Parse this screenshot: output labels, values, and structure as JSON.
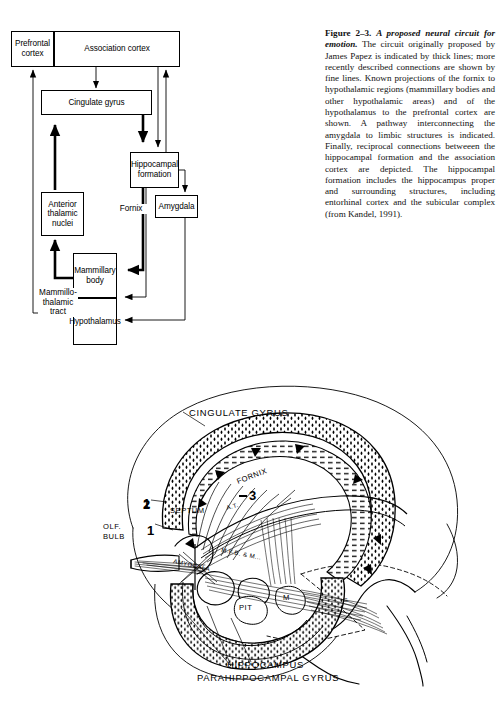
{
  "figure": {
    "caption_label": "Figure 2–3.",
    "caption_title": "A proposed neural circuit for emotion.",
    "caption_body": " The circuit originally proposed by James Papez is indicated by thick lines; more recently described connections are shown by fine lines. Known projections of the fornix to hypothalamic regions (mammillary bodies and other hypothalamic areas) and of the hypothalamus to the prefrontal cortex are shown. A pathway interconnecting the amygdala to limbic structures is indicated. Finally, reciprocal connections betweeen the hippocampal formation and the association cortex are depicted. The hippocampal formation includes the hippocampus proper and surrounding structures, including entorhinal cortex and the subicular complex (from Kandel, 1991)."
  },
  "flowchart": {
    "boxes": [
      {
        "id": "prefrontal-cortex",
        "label": "Prefrontal\ncortex"
      },
      {
        "id": "association-cortex",
        "label": "Association cortex"
      },
      {
        "id": "cingulate-gyrus",
        "label": "Cingulate gyrus"
      },
      {
        "id": "hippocampal-formation",
        "label": "Hippocampal\nformation"
      },
      {
        "id": "amygdala",
        "label": "Amygdala"
      },
      {
        "id": "anterior-thalamic-nuclei",
        "label": "Anterior\nthalamic\nnuclei"
      },
      {
        "id": "mammillary-body",
        "label": "Mammillary\nbody"
      },
      {
        "id": "hypothalamus",
        "label": "Hypothalamus"
      }
    ],
    "edge_labels": [
      {
        "id": "fornix",
        "label": "Fornix"
      },
      {
        "id": "mammillothalamic-tract",
        "label": "Mammillo-\nthalamic\ntract"
      }
    ]
  },
  "illustration": {
    "labels": [
      {
        "id": "cingulate-gyrus",
        "text": "CINGULATE  GYRUS"
      },
      {
        "id": "fornix",
        "text": "FORNIX"
      },
      {
        "id": "septum",
        "text": "SEPTUM"
      },
      {
        "id": "anterior-thalamus",
        "text": "A.T."
      },
      {
        "id": "olfactory-bulb-line1",
        "text": "OLF."
      },
      {
        "id": "olfactory-bulb-line2",
        "text": "BULB"
      },
      {
        "id": "amygdala",
        "text": "AMYGDALA"
      },
      {
        "id": "medial-forebrain-bundle",
        "text": "M.F.B. & M..."
      },
      {
        "id": "pituitary",
        "text": "PIT"
      },
      {
        "id": "mammillary",
        "text": "M"
      },
      {
        "id": "g-marker",
        "text": "G"
      },
      {
        "id": "hippocampus",
        "text": "HIPPOCAMPUS"
      },
      {
        "id": "parahippocampal-gyrus",
        "text": "PARAHIPPOCAMPAL GYRUS"
      }
    ],
    "numbers": [
      {
        "id": "marker-1",
        "text": "1"
      },
      {
        "id": "marker-2",
        "text": "2"
      },
      {
        "id": "marker-3",
        "text": "3"
      }
    ]
  }
}
